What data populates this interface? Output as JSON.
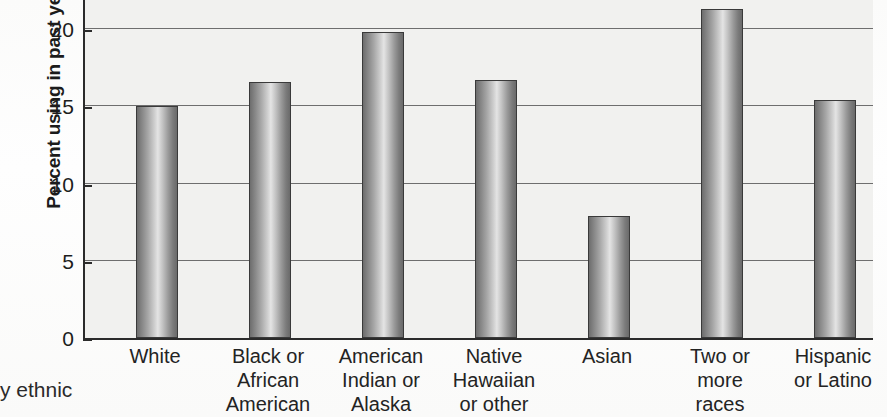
{
  "chart_data": {
    "type": "bar",
    "title": "",
    "xlabel": "",
    "ylabel": "Percent using in past year",
    "ylim": [
      0,
      22.5
    ],
    "yticks": [
      0,
      5,
      10,
      15,
      20
    ],
    "ytick_labels": [
      "0",
      "5",
      "10",
      "15",
      "20"
    ],
    "grid": true,
    "legend": false,
    "categories": [
      "White",
      "Black or African American",
      "American Indian or Alaska",
      "Native Hawaiian or other",
      "Asian",
      "Two or more races",
      "Hispanic or Latino"
    ],
    "category_lines": [
      [
        "White"
      ],
      [
        "Black or",
        "African",
        "American"
      ],
      [
        "American",
        "Indian or",
        "Alaska"
      ],
      [
        "Native",
        "Hawaiian",
        "or other"
      ],
      [
        "Asian"
      ],
      [
        "Two or",
        "more",
        "races"
      ],
      [
        "Hispanic",
        "or Latino"
      ]
    ],
    "values": [
      15.0,
      16.6,
      19.8,
      16.7,
      7.9,
      21.3,
      15.4
    ],
    "bar_color": "#a8a8a8",
    "plot_background": "#f1f1ef",
    "axis_color": "#2b2b2b"
  },
  "caption": {
    "fragment": "y ethnic"
  }
}
